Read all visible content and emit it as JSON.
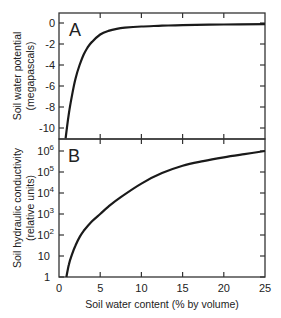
{
  "chart_data": [
    {
      "panel": "A",
      "type": "line",
      "panel_label": "A",
      "title": "",
      "xlabel": "Soil water content (% by volume)",
      "ylabel": "Soil water potential",
      "ylabel_sub": "(megapascals)",
      "xlim": [
        0,
        25
      ],
      "ylim": [
        -11,
        0.8
      ],
      "x_ticks": [
        0,
        5,
        10,
        15,
        20,
        25
      ],
      "y_ticks": [
        0,
        -2,
        -4,
        -6,
        -8,
        -10
      ],
      "y_tick_labels": [
        "0",
        "-2",
        "-4",
        "-6",
        "-8",
        "-10"
      ],
      "grid": false,
      "series": [
        {
          "name": "Soil water potential",
          "x": [
            0.8,
            1.2,
            1.6,
            2.0,
            2.5,
            3.0,
            3.5,
            4.0,
            5.0,
            6.0,
            7.0,
            8.0,
            10.0,
            12.5,
            15.0,
            20.0,
            25.0
          ],
          "y": [
            -11.0,
            -8.6,
            -6.8,
            -5.3,
            -4.0,
            -3.0,
            -2.3,
            -1.8,
            -1.1,
            -0.75,
            -0.55,
            -0.45,
            -0.33,
            -0.26,
            -0.2,
            -0.14,
            -0.1
          ]
        }
      ]
    },
    {
      "panel": "B",
      "type": "line",
      "panel_label": "B",
      "title": "",
      "xlabel": "Soil water content (% by volume)",
      "ylabel": "Soil hydraulic conductivity",
      "ylabel_sub": "(relative units)",
      "xlim": [
        0,
        25
      ],
      "ylim": [
        1,
        1000000
      ],
      "yscale": "log",
      "x_ticks": [
        0,
        5,
        10,
        15,
        20,
        25
      ],
      "x_tick_labels": [
        "0",
        "5",
        "10",
        "15",
        "20",
        "25"
      ],
      "y_ticks": [
        1,
        10,
        100,
        1000,
        10000,
        100000,
        1000000
      ],
      "y_tick_labels": [
        "1",
        "10",
        "10^2",
        "10^3",
        "10^4",
        "10^5",
        "10^6"
      ],
      "grid": false,
      "series": [
        {
          "name": "Soil hydraulic conductivity",
          "x": [
            0.9,
            1.2,
            1.6,
            2.0,
            2.5,
            3.0,
            4.0,
            5.0,
            6.0,
            7.5,
            10.0,
            12.5,
            15.0,
            17.5,
            20.0,
            22.5,
            25.0
          ],
          "log10_y": [
            0.0,
            0.6,
            1.1,
            1.5,
            1.9,
            2.2,
            2.65,
            3.0,
            3.35,
            3.8,
            4.45,
            4.95,
            5.3,
            5.52,
            5.7,
            5.85,
            6.0
          ]
        }
      ]
    }
  ],
  "labels": {
    "panel_a": "A",
    "panel_b": "B",
    "ylabel_a_line1": "Soil water potential",
    "ylabel_a_line2": "(megapascals)",
    "ylabel_b_line1": "Soil hydraulic conductivity",
    "ylabel_b_line2": "(relative units)",
    "xlabel": "Soil water content  (% by volume)"
  },
  "colors": {
    "axis": "#333333",
    "curve": "#1a1a1a",
    "text": "#222222"
  }
}
